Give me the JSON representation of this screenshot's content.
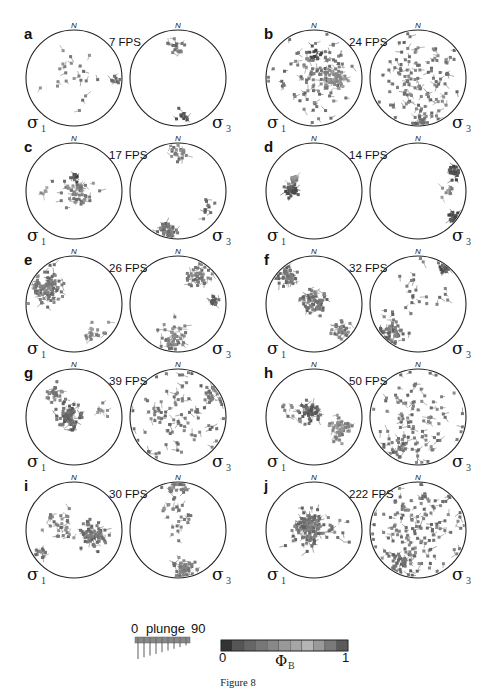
{
  "figure": {
    "caption": "Figure 8",
    "north_label": "N",
    "sigma_left": "σ",
    "sigma_left_sub": "1",
    "sigma_right": "σ",
    "sigma_right_sub": "3"
  },
  "legend": {
    "plunge": {
      "min_label": "0",
      "title": "plunge",
      "max_label": "90",
      "range": [
        0,
        90
      ]
    },
    "colorbar": {
      "min_label": "0",
      "max_label": "1",
      "symbol": "Φ",
      "symbol_sub": "B",
      "range": [
        0,
        1
      ],
      "swatches": [
        "#333333",
        "#555555",
        "#666666",
        "#777777",
        "#888888",
        "#999999",
        "#a6a6a6",
        "#b5b5b5",
        "#9a9a9a",
        "#7a7a7a",
        "#5a5a5a"
      ]
    }
  },
  "chart_data": {
    "type": "scatter",
    "title": "Figure 8",
    "panels": [
      {
        "letter": "a",
        "fps": "7 FPS",
        "sigma1": {
          "clusters": [
            {
              "x": -0.1,
              "y": 0.05,
              "spread": 0.55,
              "n": 22,
              "shade": 0.6
            },
            {
              "x": 0.85,
              "y": -0.05,
              "spread": 0.1,
              "n": 8,
              "shade": 0.4
            }
          ]
        },
        "sigma3": {
          "clusters": [
            {
              "x": -0.05,
              "y": 0.65,
              "spread": 0.15,
              "n": 16,
              "shade": 0.55
            },
            {
              "x": 0.1,
              "y": -0.8,
              "spread": 0.15,
              "n": 10,
              "shade": 0.3
            }
          ]
        }
      },
      {
        "letter": "b",
        "fps": "24 FPS",
        "sigma1": {
          "clusters": [
            {
              "x": 0.1,
              "y": 0.0,
              "spread": 0.8,
              "n": 110,
              "shade": 0.55
            },
            {
              "x": 0.4,
              "y": -0.05,
              "spread": 0.2,
              "n": 40,
              "shade": 0.7
            },
            {
              "x": 0.0,
              "y": 0.5,
              "spread": 0.15,
              "n": 12,
              "shade": 0.2
            }
          ]
        },
        "sigma3": {
          "clusters": [
            {
              "x": 0.0,
              "y": 0.0,
              "spread": 0.8,
              "n": 110,
              "shade": 0.55
            },
            {
              "x": 0.1,
              "y": -0.85,
              "spread": 0.2,
              "n": 25,
              "shade": 0.5
            }
          ]
        }
      },
      {
        "letter": "c",
        "fps": "17 FPS",
        "sigma1": {
          "clusters": [
            {
              "x": 0.1,
              "y": 0.0,
              "spread": 0.35,
              "n": 50,
              "shade": 0.6
            },
            {
              "x": 0.0,
              "y": 0.3,
              "spread": 0.1,
              "n": 8,
              "shade": 0.2
            },
            {
              "x": -0.6,
              "y": 0.0,
              "spread": 0.1,
              "n": 5,
              "shade": 0.8
            }
          ]
        },
        "sigma3": {
          "clusters": [
            {
              "x": 0.05,
              "y": 0.8,
              "spread": 0.2,
              "n": 20,
              "shade": 0.6
            },
            {
              "x": -0.2,
              "y": -0.85,
              "spread": 0.2,
              "n": 40,
              "shade": 0.5
            },
            {
              "x": 0.6,
              "y": -0.4,
              "spread": 0.2,
              "n": 10,
              "shade": 0.4
            }
          ]
        }
      },
      {
        "letter": "d",
        "fps": "14 FPS",
        "sigma1": {
          "clusters": [
            {
              "x": -0.45,
              "y": 0.0,
              "spread": 0.12,
              "n": 30,
              "shade": 0.25
            },
            {
              "x": -0.4,
              "y": 0.25,
              "spread": 0.1,
              "n": 14,
              "shade": 0.65
            }
          ]
        },
        "sigma3": {
          "clusters": [
            {
              "x": 0.75,
              "y": 0.4,
              "spread": 0.12,
              "n": 24,
              "shade": 0.25
            },
            {
              "x": 0.75,
              "y": -0.55,
              "spread": 0.12,
              "n": 22,
              "shade": 0.25
            },
            {
              "x": 0.6,
              "y": 0.0,
              "spread": 0.12,
              "n": 10,
              "shade": 0.7
            }
          ]
        }
      },
      {
        "letter": "e",
        "fps": "26 FPS",
        "sigma1": {
          "clusters": [
            {
              "x": -0.55,
              "y": 0.35,
              "spread": 0.3,
              "n": 90,
              "shade": 0.55
            },
            {
              "x": 0.45,
              "y": -0.55,
              "spread": 0.25,
              "n": 18,
              "shade": 0.7
            }
          ]
        },
        "sigma3": {
          "clusters": [
            {
              "x": 0.45,
              "y": 0.55,
              "spread": 0.25,
              "n": 40,
              "shade": 0.55
            },
            {
              "x": 0.75,
              "y": 0.05,
              "spread": 0.1,
              "n": 18,
              "shade": 0.35
            },
            {
              "x": -0.1,
              "y": -0.7,
              "spread": 0.3,
              "n": 45,
              "shade": 0.6
            }
          ]
        }
      },
      {
        "letter": "f",
        "fps": "32 FPS",
        "sigma1": {
          "clusters": [
            {
              "x": -0.55,
              "y": 0.55,
              "spread": 0.2,
              "n": 40,
              "shade": 0.5
            },
            {
              "x": 0.0,
              "y": 0.05,
              "spread": 0.25,
              "n": 60,
              "shade": 0.5
            },
            {
              "x": 0.55,
              "y": -0.55,
              "spread": 0.2,
              "n": 30,
              "shade": 0.55
            }
          ]
        },
        "sigma3": {
          "clusters": [
            {
              "x": -0.55,
              "y": -0.6,
              "spread": 0.25,
              "n": 50,
              "shade": 0.5
            },
            {
              "x": 0.55,
              "y": 0.75,
              "spread": 0.15,
              "n": 20,
              "shade": 0.35
            },
            {
              "x": 0.0,
              "y": 0.2,
              "spread": 0.7,
              "n": 25,
              "shade": 0.5
            }
          ]
        }
      },
      {
        "letter": "g",
        "fps": "39 FPS",
        "sigma1": {
          "clusters": [
            {
              "x": -0.1,
              "y": 0.0,
              "spread": 0.25,
              "n": 70,
              "shade": 0.45
            },
            {
              "x": -0.4,
              "y": 0.45,
              "spread": 0.2,
              "n": 25,
              "shade": 0.6
            },
            {
              "x": 0.6,
              "y": 0.15,
              "spread": 0.15,
              "n": 8,
              "shade": 0.7
            }
          ]
        },
        "sigma3": {
          "clusters": [
            {
              "x": 0.0,
              "y": 0.0,
              "spread": 0.95,
              "n": 90,
              "shade": 0.55
            },
            {
              "x": 0.7,
              "y": 0.5,
              "spread": 0.2,
              "n": 20,
              "shade": 0.5
            }
          ]
        }
      },
      {
        "letter": "h",
        "fps": "50 FPS",
        "sigma1": {
          "clusters": [
            {
              "x": -0.1,
              "y": 0.1,
              "spread": 0.2,
              "n": 50,
              "shade": 0.4
            },
            {
              "x": 0.55,
              "y": -0.25,
              "spread": 0.25,
              "n": 45,
              "shade": 0.65
            },
            {
              "x": -0.5,
              "y": 0.1,
              "spread": 0.25,
              "n": 10,
              "shade": 0.6
            }
          ]
        },
        "sigma3": {
          "clusters": [
            {
              "x": 0.0,
              "y": 0.0,
              "spread": 0.95,
              "n": 90,
              "shade": 0.55
            },
            {
              "x": -0.4,
              "y": -0.65,
              "spread": 0.25,
              "n": 25,
              "shade": 0.5
            }
          ]
        }
      },
      {
        "letter": "i",
        "fps": "30 FPS",
        "sigma1": {
          "clusters": [
            {
              "x": 0.4,
              "y": -0.1,
              "spread": 0.25,
              "n": 70,
              "shade": 0.5
            },
            {
              "x": -0.3,
              "y": 0.05,
              "spread": 0.3,
              "n": 30,
              "shade": 0.6
            },
            {
              "x": -0.7,
              "y": -0.45,
              "spread": 0.15,
              "n": 12,
              "shade": 0.5
            }
          ]
        },
        "sigma3": {
          "clusters": [
            {
              "x": 0.0,
              "y": 0.85,
              "spread": 0.25,
              "n": 25,
              "shade": 0.55
            },
            {
              "x": 0.0,
              "y": 0.25,
              "spread": 0.3,
              "n": 25,
              "shade": 0.6
            },
            {
              "x": 0.1,
              "y": -0.8,
              "spread": 0.25,
              "n": 45,
              "shade": 0.55
            }
          ]
        }
      },
      {
        "letter": "j",
        "fps": "222 FPS",
        "sigma1": {
          "clusters": [
            {
              "x": -0.1,
              "y": 0.05,
              "spread": 0.3,
              "n": 120,
              "shade": 0.5
            },
            {
              "x": 0.5,
              "y": -0.1,
              "spread": 0.3,
              "n": 10,
              "shade": 0.6
            }
          ]
        },
        "sigma3": {
          "clusters": [
            {
              "x": 0.0,
              "y": 0.0,
              "spread": 0.95,
              "n": 140,
              "shade": 0.55
            },
            {
              "x": -0.4,
              "y": -0.75,
              "spread": 0.25,
              "n": 30,
              "shade": 0.45
            }
          ]
        }
      }
    ]
  }
}
